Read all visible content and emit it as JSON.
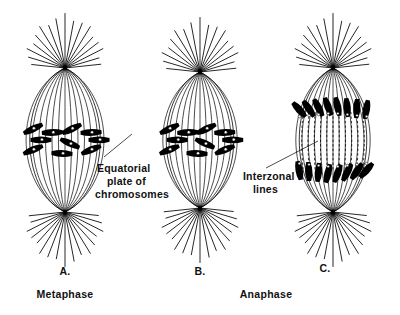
{
  "figure": {
    "background_color": "#ffffff",
    "ink_color": "#000000"
  },
  "panels": [
    {
      "id": "A",
      "letter": "A.",
      "phase_label": "Metaphase",
      "description": "Spindle with chromosomes aligned at the equatorial plate",
      "center_x": 65,
      "center_y": 140,
      "spindle_half_width": 44,
      "pole_top_y": 68,
      "pole_bottom_y": 212,
      "chromosome_count": 8,
      "has_interzonal_lines": false
    },
    {
      "id": "B",
      "letter": "B.",
      "phase_label": "",
      "description": "Spindle with chromosomes at equator showing centromeres",
      "center_x": 200,
      "center_y": 140,
      "spindle_half_width": 42,
      "pole_top_y": 72,
      "pole_bottom_y": 208,
      "chromosome_count": 8,
      "has_interzonal_lines": false
    },
    {
      "id": "C",
      "letter": "C.",
      "phase_label": "Anaphase",
      "description": "Spindle with daughter chromosomes moving to poles and interzonal lines between them",
      "center_x": 333,
      "center_y": 140,
      "spindle_half_width": 42,
      "pole_top_y": 68,
      "pole_bottom_y": 212,
      "chromosome_count": 16,
      "has_interzonal_lines": true
    }
  ],
  "callouts": [
    {
      "id": "equatorial-plate",
      "lines": [
        "Equatorial",
        "plate of",
        "chromosomes"
      ],
      "text_x": 97,
      "text_y": 172,
      "line_height": 13,
      "leader_from_x": 104,
      "leader_from_y": 157,
      "leader_to_x": 132,
      "leader_to_y": 134
    },
    {
      "id": "interzonal-lines",
      "lines": [
        "Interzonal",
        "lines"
      ],
      "text_x": 243,
      "text_y": 180,
      "line_height": 13,
      "leader_from_x": 266,
      "leader_from_y": 168,
      "leader_to_x": 318,
      "leader_to_y": 141
    }
  ],
  "captions": {
    "letters": [
      {
        "text": "A.",
        "x": 65,
        "y": 275
      },
      {
        "text": "B.",
        "x": 200,
        "y": 275
      },
      {
        "text": "C.",
        "x": 325,
        "y": 272
      }
    ],
    "phases": [
      {
        "text": "Metaphase",
        "x": 65,
        "y": 298
      },
      {
        "text": "Anaphase",
        "x": 266,
        "y": 298
      }
    ]
  },
  "chart_data": {
    "type": "diagram",
    "panel_ids": [
      "A",
      "B",
      "C"
    ],
    "panel_phases": [
      "Metaphase",
      "",
      "Anaphase"
    ],
    "annotations": [
      "Equatorial plate of chromosomes",
      "Interzonal lines"
    ],
    "spindle_fiber_count_per_panel": 13,
    "aster_ray_count_per_pole": 17
  }
}
